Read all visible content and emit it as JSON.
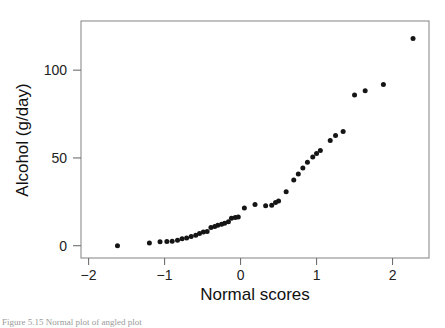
{
  "figure": {
    "kind": "scatter-qq-plot",
    "background_color": "#ffffff",
    "caption": "Figure 5.15  Normal plot of angled plot"
  },
  "axes": {
    "frame_color": "#8d8d8d",
    "x_axis_title": "Normal scores",
    "y_axis_title": "Alcohol (g/day)",
    "x_tick_labels": [
      "−2",
      "−1",
      "0",
      "1",
      "2"
    ],
    "y_tick_labels": [
      "0",
      "50",
      "100"
    ]
  },
  "chart_data": {
    "type": "scatter",
    "title": "",
    "xlabel": "Normal scores",
    "ylabel": "Alcohol (g/day)",
    "xlim": [
      -2.1,
      2.48
    ],
    "ylim": [
      -7,
      128
    ],
    "xticks": [
      -2,
      -1,
      0,
      1,
      2
    ],
    "yticks": [
      0,
      50,
      100
    ],
    "grid": false,
    "legend": "none",
    "marker": "filled-circle",
    "marker_color": "#151515",
    "series": [
      {
        "name": "Alcohol (g/day) vs normal scores",
        "points": [
          [
            -1.62,
            0.0
          ],
          [
            -1.2,
            1.5
          ],
          [
            -1.06,
            2.2
          ],
          [
            -0.97,
            2.4
          ],
          [
            -0.9,
            2.6
          ],
          [
            -0.83,
            3.1
          ],
          [
            -0.77,
            3.9
          ],
          [
            -0.71,
            4.4
          ],
          [
            -0.65,
            5.2
          ],
          [
            -0.59,
            6.0
          ],
          [
            -0.54,
            6.9
          ],
          [
            -0.49,
            7.8
          ],
          [
            -0.44,
            8.1
          ],
          [
            -0.39,
            10.4
          ],
          [
            -0.34,
            11.0
          ],
          [
            -0.3,
            11.6
          ],
          [
            -0.25,
            12.2
          ],
          [
            -0.21,
            12.8
          ],
          [
            -0.16,
            13.6
          ],
          [
            -0.12,
            15.6
          ],
          [
            -0.07,
            16.0
          ],
          [
            -0.03,
            16.3
          ],
          [
            0.05,
            21.5
          ],
          [
            0.19,
            23.5
          ],
          [
            0.33,
            22.8
          ],
          [
            0.41,
            23.0
          ],
          [
            0.46,
            24.6
          ],
          [
            0.5,
            25.5
          ],
          [
            0.6,
            30.8
          ],
          [
            0.7,
            37.5
          ],
          [
            0.76,
            40.8
          ],
          [
            0.82,
            44.3
          ],
          [
            0.88,
            47.6
          ],
          [
            0.95,
            50.6
          ],
          [
            1.0,
            52.5
          ],
          [
            1.05,
            54.2
          ],
          [
            1.18,
            60.0
          ],
          [
            1.25,
            62.8
          ],
          [
            1.35,
            65.0
          ],
          [
            1.5,
            85.8
          ],
          [
            1.64,
            88.2
          ],
          [
            1.88,
            91.8
          ],
          [
            2.27,
            118.0
          ]
        ]
      }
    ]
  }
}
